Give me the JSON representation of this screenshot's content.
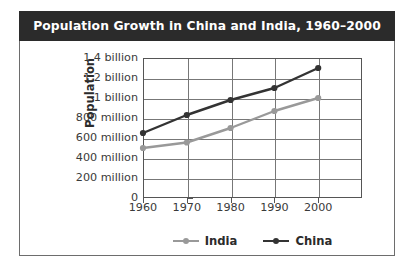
{
  "figure": {
    "title": "Population Growth in China and India, 1960–2000",
    "background_color": "#ffffff",
    "title_bar_color": "#2b2b2b",
    "title_text_color": "#ffffff",
    "border_color": "#6d6d6d"
  },
  "legend": {
    "position": "bottom-center",
    "entries": [
      {
        "label": "India",
        "color": "#999999"
      },
      {
        "label": "China",
        "color": "#333333"
      }
    ]
  },
  "chart_data": {
    "type": "line",
    "title": "Population Growth in China and India, 1960–2000",
    "xlabel": "",
    "ylabel": "Population",
    "x": [
      1960,
      1970,
      1980,
      1990,
      2000
    ],
    "xtick_labels": [
      "1960",
      "1970",
      "1980",
      "1990",
      "2000"
    ],
    "ytick_labels": [
      "0",
      "200 million",
      "400 million",
      "600 million",
      "800 million",
      "1 billion",
      "1.2 billion",
      "1.4 billion"
    ],
    "ytick_values": [
      0,
      200000000,
      400000000,
      600000000,
      800000000,
      1000000000,
      1200000000,
      1400000000
    ],
    "ylim": [
      0,
      1400000000
    ],
    "xlim": [
      1960,
      2010
    ],
    "grid": true,
    "series": [
      {
        "name": "India",
        "color": "#999999",
        "marker": "circle",
        "values": [
          500000000,
          555000000,
          700000000,
          870000000,
          1000000000
        ],
        "value_labels": [
          "500 million",
          "555 million",
          "700 million",
          "870 million",
          "1 billion"
        ]
      },
      {
        "name": "China",
        "color": "#333333",
        "marker": "circle",
        "values": [
          650000000,
          830000000,
          980000000,
          1100000000,
          1300000000
        ],
        "value_labels": [
          "650 million",
          "830 million",
          "980 million",
          "1.1 billion",
          "1.3 billion"
        ]
      }
    ]
  }
}
